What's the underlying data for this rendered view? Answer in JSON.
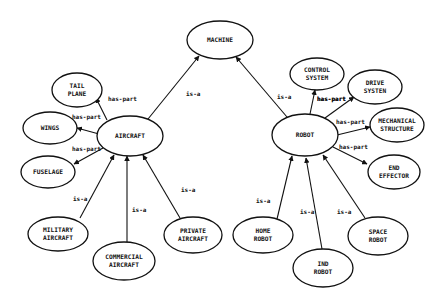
{
  "diagram": {
    "title": "",
    "colors": {
      "stroke": "#111111",
      "background": "#ffffff"
    },
    "nodes": [
      {
        "id": "machine",
        "lines": [
          "MACHINE"
        ],
        "cx": 220,
        "cy": 40,
        "rx": 33,
        "ry": 19
      },
      {
        "id": "aircraft",
        "lines": [
          "AIRCRAFT"
        ],
        "cx": 130,
        "cy": 136,
        "rx": 33,
        "ry": 20
      },
      {
        "id": "robot",
        "lines": [
          "ROBOT"
        ],
        "cx": 305,
        "cy": 135,
        "rx": 33,
        "ry": 21
      },
      {
        "id": "tail-plane",
        "lines": [
          "TAIL",
          "PLANE"
        ],
        "cx": 77,
        "cy": 90,
        "rx": 25,
        "ry": 17
      },
      {
        "id": "wings",
        "lines": [
          "WINGS"
        ],
        "cx": 50,
        "cy": 128,
        "rx": 27,
        "ry": 16
      },
      {
        "id": "fuselage",
        "lines": [
          "FUSELAGE"
        ],
        "cx": 48,
        "cy": 172,
        "rx": 27,
        "ry": 16
      },
      {
        "id": "military-aircraft",
        "lines": [
          "MILITARY",
          "AIRCRAFT"
        ],
        "cx": 58,
        "cy": 234,
        "rx": 30,
        "ry": 17
      },
      {
        "id": "commercial-aircraft",
        "lines": [
          "COMMERCIAL",
          "AIRCRAFT"
        ],
        "cx": 124,
        "cy": 261,
        "rx": 31,
        "ry": 19
      },
      {
        "id": "private-aircraft",
        "lines": [
          "PRIVATE",
          "AIRCRAFT"
        ],
        "cx": 193,
        "cy": 235,
        "rx": 29,
        "ry": 18
      },
      {
        "id": "control-system",
        "lines": [
          "CONTROL",
          "SYSTEM"
        ],
        "cx": 317,
        "cy": 74,
        "rx": 27,
        "ry": 16
      },
      {
        "id": "drive-system",
        "lines": [
          "DRIVE",
          "SYSTEN"
        ],
        "cx": 375,
        "cy": 87,
        "rx": 27,
        "ry": 17
      },
      {
        "id": "mechanical-structure",
        "lines": [
          "MECHANICAL",
          "STRUCTURE"
        ],
        "cx": 397,
        "cy": 125,
        "rx": 27,
        "ry": 17
      },
      {
        "id": "end-effector",
        "lines": [
          "END",
          "EFFECTOR"
        ],
        "cx": 394,
        "cy": 172,
        "rx": 26,
        "ry": 17
      },
      {
        "id": "home-robot",
        "lines": [
          "HOME",
          "ROBOT"
        ],
        "cx": 263,
        "cy": 235,
        "rx": 30,
        "ry": 18
      },
      {
        "id": "ind-robot",
        "lines": [
          "IND",
          "ROBOT"
        ],
        "cx": 323,
        "cy": 268,
        "rx": 30,
        "ry": 19
      },
      {
        "id": "space-robot",
        "lines": [
          "SPACE",
          "ROBOT"
        ],
        "cx": 378,
        "cy": 236,
        "rx": 30,
        "ry": 19
      }
    ],
    "edges": [
      {
        "from": "aircraft",
        "to": "machine",
        "label": "is-a",
        "x1": 148,
        "y1": 119,
        "x2": 199,
        "y2": 56,
        "lx": 186,
        "ly": 96
      },
      {
        "from": "robot",
        "to": "machine",
        "label": "is-a",
        "x1": 287,
        "y1": 117,
        "x2": 236,
        "y2": 57,
        "lx": 277,
        "ly": 99
      },
      {
        "from": "aircraft",
        "to": "tail-plane",
        "label": "has-part",
        "x1": 107,
        "y1": 120,
        "x2": 96,
        "y2": 98,
        "lx": 108,
        "ly": 101
      },
      {
        "from": "aircraft",
        "to": "wings",
        "label": "has-part",
        "x1": 99,
        "y1": 134,
        "x2": 77,
        "y2": 128,
        "lx": 72,
        "ly": 119
      },
      {
        "from": "aircraft",
        "to": "fuselage",
        "label": "has-part",
        "x1": 103,
        "y1": 148,
        "x2": 74,
        "y2": 164,
        "lx": 72,
        "ly": 151
      },
      {
        "from": "military-aircraft",
        "to": "aircraft",
        "label": "is-a",
        "x1": 80,
        "y1": 218,
        "x2": 114,
        "y2": 155,
        "lx": 73,
        "ly": 201
      },
      {
        "from": "commercial-aircraft",
        "to": "aircraft",
        "label": "is-a",
        "x1": 127,
        "y1": 242,
        "x2": 127,
        "y2": 156,
        "lx": 132,
        "ly": 212
      },
      {
        "from": "private-aircraft",
        "to": "aircraft",
        "label": "is-a",
        "x1": 180,
        "y1": 218,
        "x2": 143,
        "y2": 155,
        "lx": 181,
        "ly": 192
      },
      {
        "from": "robot",
        "to": "control-system",
        "label": "has-part",
        "x1": 310,
        "y1": 114,
        "x2": 315,
        "y2": 90,
        "lx": 317,
        "ly": 101
      },
      {
        "from": "robot",
        "to": "drive-system",
        "label": "has-part",
        "x1": 325,
        "y1": 118,
        "x2": 354,
        "y2": 97,
        "lx": 317,
        "ly": 101
      },
      {
        "from": "robot",
        "to": "mechanical-structure",
        "label": "has-part",
        "x1": 337,
        "y1": 135,
        "x2": 370,
        "y2": 127,
        "lx": 336,
        "ly": 124
      },
      {
        "from": "robot",
        "to": "end-effector",
        "label": "has-part",
        "x1": 333,
        "y1": 147,
        "x2": 367,
        "y2": 164,
        "lx": 339,
        "ly": 149
      },
      {
        "from": "home-robot",
        "to": "robot",
        "label": "is-a",
        "x1": 277,
        "y1": 219,
        "x2": 292,
        "y2": 156,
        "lx": 256,
        "ly": 203
      },
      {
        "from": "ind-robot",
        "to": "robot",
        "label": "is-a",
        "x1": 322,
        "y1": 249,
        "x2": 306,
        "y2": 158,
        "lx": 300,
        "ly": 214
      },
      {
        "from": "space-robot",
        "to": "robot",
        "label": "is-a",
        "x1": 365,
        "y1": 218,
        "x2": 323,
        "y2": 155,
        "lx": 337,
        "ly": 214
      }
    ]
  }
}
